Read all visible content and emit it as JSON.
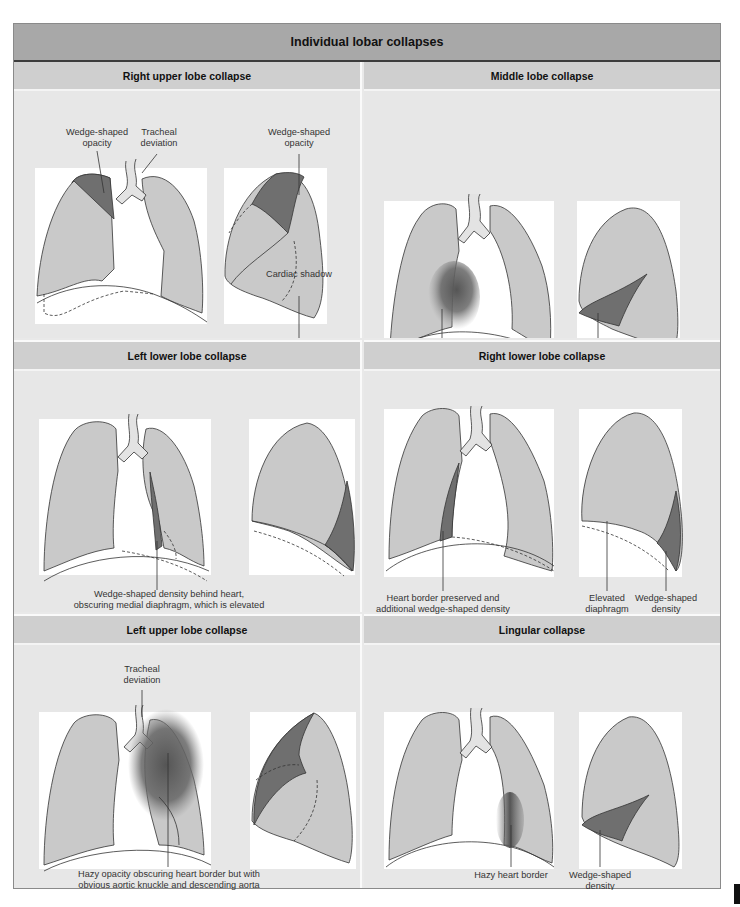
{
  "title": "Individual lobar collapses",
  "colors": {
    "lung": "#c9c9c9",
    "dense": "#6f6f6f",
    "trachea": "#e3e3e3",
    "outline": "#333333",
    "header_main": "#a8a8a8",
    "header_panel": "#cfcfcf",
    "panel_bg": "#e7e7e7"
  },
  "panels": [
    {
      "id": "right-upper-lobe",
      "title": "Right upper lobe collapse",
      "labels": {
        "wedge_frontal_1": "Wedge-shaped",
        "wedge_frontal_2": "opacity",
        "tracheal_1": "Tracheal",
        "tracheal_2": "deviation",
        "wedge_lateral_1": "Wedge-shaped",
        "wedge_lateral_2": "opacity",
        "cardiac": "Cardiac shadow"
      }
    },
    {
      "id": "middle-lobe",
      "title": "Middle lobe collapse",
      "labels": {
        "hazy_1": "Hazy opacification with",
        "hazy_2": "loss of right heart border",
        "dense_1": "Dense wedge-",
        "dense_2": "shaped opacity"
      }
    },
    {
      "id": "left-lower-lobe",
      "title": "Left lower lobe collapse",
      "labels": {
        "wedge_1": "Wedge-shaped density behind heart,",
        "wedge_2": "obscuring medial diaphragm, which is elevated"
      }
    },
    {
      "id": "right-lower-lobe",
      "title": "Right lower lobe collapse",
      "labels": {
        "heart_1": "Heart border preserved and",
        "heart_2": "additional wedge-shaped density",
        "elev_1": "Elevated",
        "elev_2": "diaphragm",
        "wedge_1": "Wedge-shaped",
        "wedge_2": "density"
      }
    },
    {
      "id": "left-upper-lobe",
      "title": "Left upper lobe collapse",
      "labels": {
        "tracheal_1": "Tracheal",
        "tracheal_2": "deviation",
        "hazy_1": "Hazy opacity obscuring heart border but with",
        "hazy_2": "obvious aortic knuckle and descending aorta"
      }
    },
    {
      "id": "lingular",
      "title": "Lingular collapse",
      "labels": {
        "hazy": "Hazy heart border",
        "wedge_1": "Wedge-shaped",
        "wedge_2": "density"
      }
    }
  ]
}
